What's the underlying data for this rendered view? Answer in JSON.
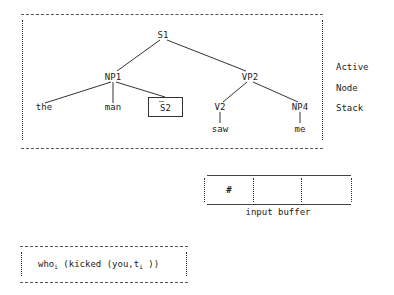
{
  "tree": {
    "nodes": {
      "s1": "S1",
      "np1": "NP1",
      "vp2": "VP2",
      "the": "the",
      "man": "man",
      "s2": "S2",
      "v2": "V2",
      "np4": "NP4",
      "saw": "saw",
      "me": "me"
    },
    "s2_bar": "—"
  },
  "stack_label": {
    "line1": "Active",
    "line2": "Node",
    "line3": "Stack"
  },
  "input_buffer": {
    "cells": [
      "#",
      "",
      ""
    ],
    "label": "input buffer"
  },
  "expression": {
    "part1": "who",
    "sub1": "i",
    "part2": " (kicked (you,t",
    "sub2": "i",
    "part3": " ))"
  },
  "colors": {
    "ink": "#222222",
    "background": "#ffffff"
  }
}
